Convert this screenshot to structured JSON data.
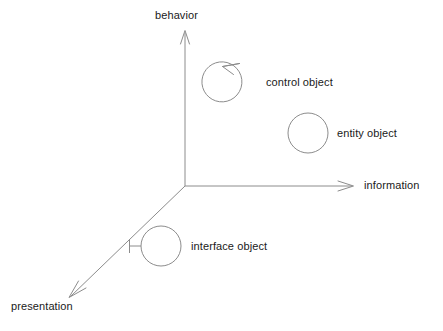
{
  "diagram": {
    "type": "three-axis-object-space",
    "background_color": "#ffffff",
    "line_color": "#8c8c8c",
    "text_color": "#1a1a1a",
    "axes": [
      {
        "id": "behavior",
        "label": "behavior",
        "direction": "up",
        "label_position": {
          "x": 155,
          "y": 10
        }
      },
      {
        "id": "information",
        "label": "information",
        "direction": "right",
        "label_position": {
          "x": 364,
          "y": 180
        }
      },
      {
        "id": "presentation",
        "label": "presentation",
        "direction": "down-left",
        "label_position": {
          "x": 11,
          "y": 301
        }
      }
    ],
    "origin": {
      "x": 185,
      "y": 186
    },
    "objects": [
      {
        "id": "control-object",
        "label": "control object",
        "stereotype": "control",
        "circle": {
          "cx": 223,
          "cy": 83,
          "r": 20
        },
        "label_position": {
          "x": 266,
          "y": 77
        },
        "notation": "circle with counter-clockwise arrow on top"
      },
      {
        "id": "entity-object",
        "label": "entity object",
        "stereotype": "entity",
        "circle": {
          "cx": 308,
          "cy": 133,
          "r": 20
        },
        "label_position": {
          "x": 337,
          "y": 128
        },
        "notation": "plain circle"
      },
      {
        "id": "interface-object",
        "label": "interface object",
        "stereotype": "interface",
        "circle": {
          "cx": 161,
          "cy": 246,
          "r": 20
        },
        "label_position": {
          "x": 191,
          "y": 241
        },
        "notation": "circle with lollipop bar on left"
      }
    ]
  }
}
